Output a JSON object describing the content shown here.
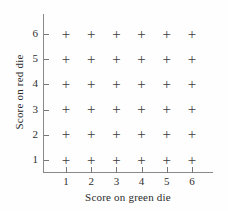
{
  "chart_data": {
    "type": "scatter",
    "title": "",
    "xlabel": "Score on green die",
    "ylabel": "Score on red die",
    "xticks": [
      "1",
      "2",
      "3",
      "4",
      "5",
      "6"
    ],
    "yticks": [
      "1",
      "2",
      "3",
      "4",
      "5",
      "6"
    ],
    "xlim": [
      0,
      7
    ],
    "ylim": [
      0,
      7
    ],
    "grid": false,
    "legend": null,
    "marker": "+",
    "marker_color": "#3b3b3b",
    "axis_color": "#8a8a8a",
    "background": "#fefefe",
    "point_count": 36,
    "points": [
      {
        "x": 1,
        "y": 1
      },
      {
        "x": 2,
        "y": 1
      },
      {
        "x": 3,
        "y": 1
      },
      {
        "x": 4,
        "y": 1
      },
      {
        "x": 5,
        "y": 1
      },
      {
        "x": 6,
        "y": 1
      },
      {
        "x": 1,
        "y": 2
      },
      {
        "x": 2,
        "y": 2
      },
      {
        "x": 3,
        "y": 2
      },
      {
        "x": 4,
        "y": 2
      },
      {
        "x": 5,
        "y": 2
      },
      {
        "x": 6,
        "y": 2
      },
      {
        "x": 1,
        "y": 3
      },
      {
        "x": 2,
        "y": 3
      },
      {
        "x": 3,
        "y": 3
      },
      {
        "x": 4,
        "y": 3
      },
      {
        "x": 5,
        "y": 3
      },
      {
        "x": 6,
        "y": 3
      },
      {
        "x": 1,
        "y": 4
      },
      {
        "x": 2,
        "y": 4
      },
      {
        "x": 3,
        "y": 4
      },
      {
        "x": 4,
        "y": 4
      },
      {
        "x": 5,
        "y": 4
      },
      {
        "x": 6,
        "y": 4
      },
      {
        "x": 1,
        "y": 5
      },
      {
        "x": 2,
        "y": 5
      },
      {
        "x": 3,
        "y": 5
      },
      {
        "x": 4,
        "y": 5
      },
      {
        "x": 5,
        "y": 5
      },
      {
        "x": 6,
        "y": 5
      },
      {
        "x": 1,
        "y": 6
      },
      {
        "x": 2,
        "y": 6
      },
      {
        "x": 3,
        "y": 6
      },
      {
        "x": 4,
        "y": 6
      },
      {
        "x": 5,
        "y": 6
      },
      {
        "x": 6,
        "y": 6
      }
    ]
  }
}
